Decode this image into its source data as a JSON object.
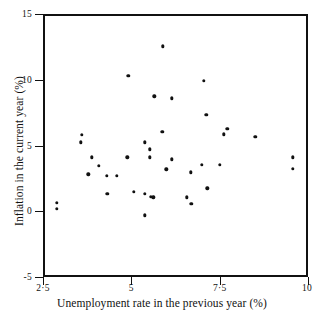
{
  "chart_data": {
    "type": "scatter",
    "title": "",
    "xlabel": "Unemployment rate in the previous year (%)",
    "ylabel": "Inflation in the current year (%)",
    "xlim": [
      2.5,
      10
    ],
    "ylim": [
      -5,
      15
    ],
    "xticks": [
      2.5,
      5,
      7.5,
      10
    ],
    "xtick_labels": [
      "2·5",
      "5",
      "7·5",
      "10"
    ],
    "yticks": [
      -5,
      0,
      5,
      10,
      15
    ],
    "ytick_labels": [
      "-5",
      "0",
      "5",
      "10",
      "15"
    ],
    "grid": false,
    "legend": null,
    "marker": {
      "shape": "circle",
      "color": "#111111",
      "size": 3.4
    },
    "series": [
      {
        "name": "observations",
        "points": [
          {
            "x": 2.84,
            "y": 0.8
          },
          {
            "x": 2.84,
            "y": 0.35
          },
          {
            "x": 3.55,
            "y": 5.95
          },
          {
            "x": 3.52,
            "y": 5.4
          },
          {
            "x": 3.83,
            "y": 4.25
          },
          {
            "x": 4.02,
            "y": 3.6
          },
          {
            "x": 3.73,
            "y": 2.95
          },
          {
            "x": 4.25,
            "y": 2.85
          },
          {
            "x": 4.54,
            "y": 2.85
          },
          {
            "x": 4.26,
            "y": 1.5
          },
          {
            "x": 4.86,
            "y": 10.45
          },
          {
            "x": 4.83,
            "y": 4.25
          },
          {
            "x": 5.02,
            "y": 1.65
          },
          {
            "x": 5.32,
            "y": 5.4
          },
          {
            "x": 5.32,
            "y": 1.5
          },
          {
            "x": 5.47,
            "y": 4.85
          },
          {
            "x": 5.47,
            "y": 4.25
          },
          {
            "x": 5.5,
            "y": 1.25
          },
          {
            "x": 5.57,
            "y": 1.2
          },
          {
            "x": 5.32,
            "y": -0.15
          },
          {
            "x": 5.59,
            "y": 8.9
          },
          {
            "x": 5.82,
            "y": 6.2
          },
          {
            "x": 5.83,
            "y": 12.7
          },
          {
            "x": 5.93,
            "y": 3.35
          },
          {
            "x": 6.09,
            "y": 8.75
          },
          {
            "x": 6.09,
            "y": 4.1
          },
          {
            "x": 6.52,
            "y": 1.2
          },
          {
            "x": 6.62,
            "y": 3.1
          },
          {
            "x": 6.64,
            "y": 0.7
          },
          {
            "x": 7.0,
            "y": 10.05
          },
          {
            "x": 7.06,
            "y": 7.5
          },
          {
            "x": 7.09,
            "y": 1.9
          },
          {
            "x": 6.94,
            "y": 3.7
          },
          {
            "x": 7.44,
            "y": 3.7
          },
          {
            "x": 7.56,
            "y": 6.0
          },
          {
            "x": 7.66,
            "y": 6.4
          },
          {
            "x": 8.45,
            "y": 5.8
          },
          {
            "x": 9.52,
            "y": 4.25
          },
          {
            "x": 9.52,
            "y": 3.4
          }
        ]
      }
    ]
  }
}
